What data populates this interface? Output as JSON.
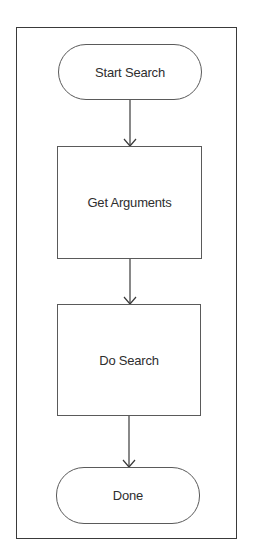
{
  "diagram": {
    "type": "flowchart",
    "direction": "top-to-bottom",
    "colors": {
      "stroke": "#3a3a3a",
      "text": "#2e2e2e",
      "background": "#ffffff"
    },
    "nodes": [
      {
        "id": "start",
        "shape": "terminator",
        "label": "Start Search"
      },
      {
        "id": "get",
        "shape": "process",
        "label": "Get Arguments"
      },
      {
        "id": "do",
        "shape": "process",
        "label": "Do Search"
      },
      {
        "id": "done",
        "shape": "terminator",
        "label": "Done"
      }
    ],
    "edges": [
      {
        "from": "start",
        "to": "get",
        "arrow": "open-chevron"
      },
      {
        "from": "get",
        "to": "do",
        "arrow": "open-chevron"
      },
      {
        "from": "do",
        "to": "done",
        "arrow": "open-chevron"
      }
    ]
  }
}
